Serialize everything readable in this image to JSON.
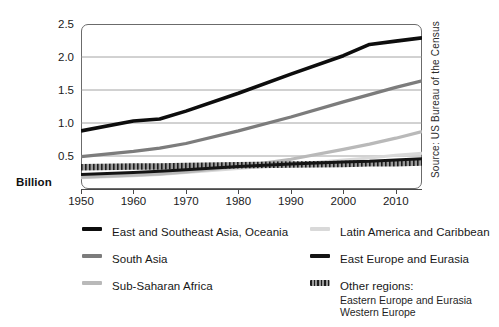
{
  "chart_data": {
    "type": "line",
    "title": "",
    "subtitle": "",
    "xlabel": "",
    "ylabel": "Billion",
    "xlim": [
      1950,
      2015
    ],
    "ylim": [
      0,
      2.5
    ],
    "yticks": [
      "0.5",
      "1.0",
      "1.5",
      "2.0",
      "2.5"
    ],
    "ytick_values": [
      0.5,
      1.0,
      1.5,
      2.0,
      2.5
    ],
    "xticks": [
      "1950",
      "1960",
      "1970",
      "1980",
      "1990",
      "2000",
      "2010"
    ],
    "xtick_values": [
      1950,
      1960,
      1970,
      1980,
      1990,
      2000,
      2010
    ],
    "grid": "horizontal",
    "legend_position": "below",
    "x": [
      1950,
      1960,
      1965,
      1970,
      1980,
      1990,
      2000,
      2005,
      2010,
      2015
    ],
    "series": [
      {
        "name": "East and Southeast Asia, Oceania",
        "color": "#0d0d0d",
        "width": 3.6,
        "values": [
          0.88,
          1.03,
          1.06,
          1.18,
          1.45,
          1.74,
          2.02,
          2.19,
          2.24,
          2.29
        ]
      },
      {
        "name": "South Asia",
        "color": "#7c7c7c",
        "width": 3.2,
        "values": [
          0.49,
          0.57,
          0.62,
          0.69,
          0.88,
          1.09,
          1.32,
          1.43,
          1.54,
          1.64
        ]
      },
      {
        "name": "Sub-Saharan Africa",
        "color": "#b9b9b9",
        "width": 3.2,
        "values": [
          0.18,
          0.21,
          0.23,
          0.26,
          0.34,
          0.45,
          0.6,
          0.68,
          0.77,
          0.87
        ]
      },
      {
        "name": "Latin America and Caribbean",
        "color": "#d9d9d9",
        "width": 3.0,
        "values": [
          0.17,
          0.2,
          0.22,
          0.25,
          0.31,
          0.37,
          0.44,
          0.47,
          0.51,
          0.54
        ]
      },
      {
        "name": "East Europe and Eurasia",
        "color": "#141414",
        "width": 3.0,
        "values": [
          0.22,
          0.25,
          0.27,
          0.29,
          0.34,
          0.38,
          0.41,
          0.42,
          0.44,
          0.46
        ]
      },
      {
        "name": "Other regions",
        "color": "#4a4a4a",
        "width": 6.5,
        "hatched": true,
        "values": [
          0.33,
          0.34,
          0.34,
          0.35,
          0.36,
          0.37,
          0.38,
          0.39,
          0.39,
          0.4
        ]
      }
    ]
  },
  "axis": {
    "y_title": "Billion",
    "ytick_labels": [
      "2.5",
      "2.0",
      "1.5",
      "1.0",
      "0.5"
    ],
    "xtick_labels": [
      "1950",
      "1960",
      "1970",
      "1980",
      "1990",
      "2000",
      "2010"
    ]
  },
  "source": {
    "text": "Source: US Bureau of the Census"
  },
  "legend": {
    "left_column": [
      {
        "label": "East and Southeast Asia, Oceania",
        "swatch": "black-line",
        "color": "#0d0d0d"
      },
      {
        "label": "South Asia",
        "swatch": "gray-line",
        "color": "#7c7c7c"
      },
      {
        "label": "Sub-Saharan Africa",
        "swatch": "light-gray-line",
        "color": "#b9b9b9"
      }
    ],
    "right_column": [
      {
        "label": "Latin America and Caribbean",
        "swatch": "pale-gray-line",
        "color": "#d9d9d9"
      },
      {
        "label": "East Europe and Eurasia",
        "swatch": "black-line",
        "color": "#141414"
      },
      {
        "label": "Other regions:",
        "swatch": "hatched-band",
        "color": "#4a4a4a",
        "sublabels": [
          "Eastern Europe and Eurasia",
          "Western Europe"
        ]
      }
    ]
  }
}
